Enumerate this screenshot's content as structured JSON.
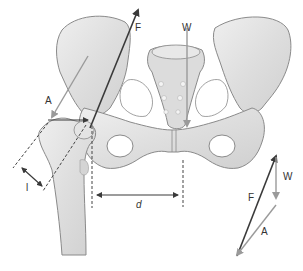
{
  "diagram": {
    "labels": {
      "force_joint": "F",
      "body_weight": "W",
      "abductor_force": "A",
      "lever_arm_abductor": "l",
      "lever_arm_weight": "d"
    },
    "vector_triangle": {
      "force_joint": "F",
      "body_weight": "W",
      "abductor_force": "A"
    },
    "colors": {
      "bone_fill": "#e6e6e6",
      "bone_shade": "#c9c9c9",
      "bone_outline": "#8a8a8a",
      "force_dark": "#3a3a3a",
      "force_light": "#9a9a9a",
      "background": "#ffffff"
    }
  }
}
